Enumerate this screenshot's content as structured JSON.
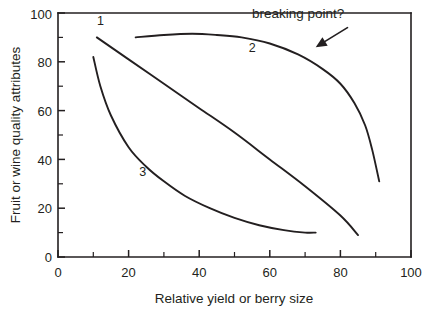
{
  "chart_data": {
    "type": "line",
    "title": "",
    "subtitle": "",
    "xlabel": "Relative yield or berry size",
    "ylabel": "Fruit or wine quality attributes",
    "xlim": [
      0,
      100
    ],
    "ylim": [
      0,
      100
    ],
    "xticks": [
      0,
      20,
      40,
      60,
      80,
      100
    ],
    "yticks": [
      0,
      20,
      40,
      60,
      80,
      100
    ],
    "xtick_labels": [
      "0",
      "20",
      "40",
      "60",
      "80",
      "100"
    ],
    "ytick_labels": [
      "0",
      "20",
      "40",
      "60",
      "80",
      "100"
    ],
    "minor_xticks": [
      10,
      30,
      50,
      70,
      90
    ],
    "minor_yticks": [
      10,
      30,
      50,
      70,
      90
    ],
    "grid": false,
    "legend": "none",
    "frame": "left-bottom-top-right-partial",
    "series": [
      {
        "name": "1",
        "label": "1",
        "label_x": 12,
        "label_y": 95,
        "description": "near-linear steady decline",
        "x": [
          11,
          20,
          30,
          40,
          50,
          60,
          70,
          80,
          85
        ],
        "y": [
          90,
          81,
          71,
          61,
          51,
          40,
          29,
          17,
          9
        ]
      },
      {
        "name": "2",
        "label": "2",
        "label_x": 55,
        "label_y": 84,
        "description": "plateau then sharp drop at breaking point",
        "x": [
          22,
          30,
          38,
          45,
          52,
          60,
          68,
          75,
          80,
          84,
          87,
          89,
          91
        ],
        "y": [
          90,
          91,
          91.5,
          91,
          90,
          87.5,
          83,
          77,
          71,
          63,
          54,
          44,
          31
        ]
      },
      {
        "name": "3",
        "label": "3",
        "label_x": 24,
        "label_y": 33,
        "description": "steep early decline flattening to low plateau",
        "x": [
          10,
          12,
          15,
          20,
          25,
          30,
          36,
          43,
          50,
          57,
          64,
          70,
          73
        ],
        "y": [
          82,
          70,
          58,
          45,
          37,
          31,
          25,
          20,
          16,
          13,
          11,
          10,
          10
        ]
      }
    ],
    "annotations": [
      {
        "text": "breaking point?",
        "text_x": 68,
        "text_y": 98,
        "arrow_from_x": 82,
        "arrow_from_y": 94,
        "arrow_to_x": 73,
        "arrow_to_y": 86
      }
    ]
  }
}
